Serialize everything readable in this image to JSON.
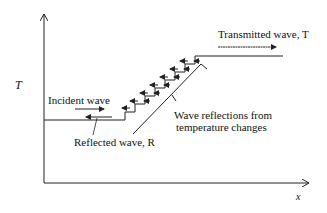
{
  "diagram": {
    "axes": {
      "y_label": "T",
      "x_label": "x"
    },
    "labels": {
      "transmitted": "Transmitted wave, T",
      "incident": "Incident wave",
      "reflected": "Reflected wave, R",
      "reflections_line1": "Wave reflections from",
      "reflections_line2": "temperature changes"
    },
    "colors": {
      "line": "#222222",
      "background": "#ffffff"
    },
    "profile": {
      "low_level_y": 120,
      "high_level_y": 56,
      "steps": 8
    }
  }
}
